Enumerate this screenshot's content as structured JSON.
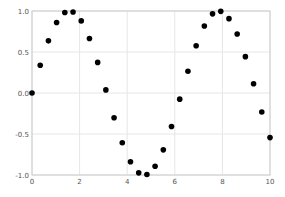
{
  "chart_data": {
    "type": "scatter",
    "title": "",
    "xlabel": "",
    "ylabel": "",
    "xlim": [
      0,
      10
    ],
    "ylim": [
      -1.0,
      1.0
    ],
    "grid": true,
    "legend": null,
    "x_ticks": [
      "0",
      "2",
      "4",
      "6",
      "8",
      "10"
    ],
    "y_ticks": [
      "1.0",
      "0.5",
      "0.0",
      "-0.5",
      "-1.0"
    ],
    "series": [
      {
        "name": "sin(x)",
        "marker": "o",
        "color": "#000000",
        "x": [
          0.0,
          0.345,
          0.69,
          1.034,
          1.379,
          1.724,
          2.069,
          2.414,
          2.759,
          3.103,
          3.448,
          3.793,
          4.138,
          4.483,
          4.828,
          5.172,
          5.517,
          5.862,
          6.207,
          6.552,
          6.897,
          7.241,
          7.586,
          7.931,
          8.276,
          8.621,
          8.966,
          9.31,
          9.655,
          10.0
        ],
        "y": [
          0.0,
          0.338,
          0.636,
          0.86,
          0.982,
          0.988,
          0.879,
          0.665,
          0.373,
          0.038,
          -0.301,
          -0.606,
          -0.839,
          -0.974,
          -0.993,
          -0.894,
          -0.693,
          -0.408,
          -0.075,
          0.266,
          0.576,
          0.817,
          0.965,
          0.996,
          0.907,
          0.72,
          0.443,
          0.112,
          -0.231,
          -0.544
        ]
      }
    ]
  }
}
